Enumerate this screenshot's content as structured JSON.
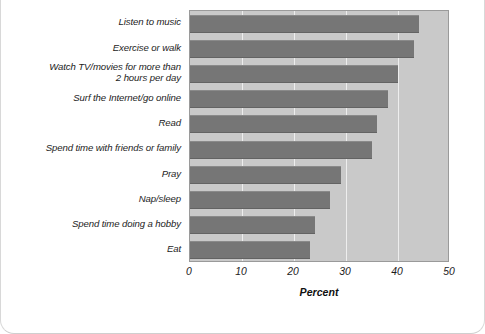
{
  "chart_data": {
    "type": "bar",
    "orientation": "horizontal",
    "title": "",
    "xlabel": "Percent",
    "ylabel": "",
    "xlim": [
      0,
      50
    ],
    "xticks": [
      0,
      10,
      20,
      30,
      40,
      50
    ],
    "xticklabels": [
      "0",
      "10",
      "20",
      "30",
      "40",
      "50"
    ],
    "grid": true,
    "grid_axis": "x",
    "legend": false,
    "categories": [
      "Listen to music",
      "Exercise or walk",
      "Watch TV/movies for more than\n2 hours per day",
      "Surf the Internet/go online",
      "Read",
      "Spend time with friends or family",
      "Pray",
      "Nap/sleep",
      "Spend time doing a hobby",
      "Eat"
    ],
    "values": [
      44,
      43,
      40,
      38,
      36,
      35,
      29,
      27,
      24,
      23
    ],
    "colors": {
      "bar": "#767676",
      "plot_background": "#c9c9c9",
      "plot_border": "#9a9a9a",
      "gridline": "#eeeeee",
      "text": "#1c1c1c",
      "page_background": "#ffffff",
      "card_border": "#d8d8d8"
    }
  }
}
